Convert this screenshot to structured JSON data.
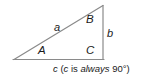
{
  "figure": {
    "type": "right-triangle-diagram",
    "background_color": "#ffffff",
    "stroke_color": "#808080",
    "text_color": "#1a1a1a",
    "vertex_labels": [
      {
        "id": "A",
        "text": "A",
        "x": 38,
        "y": 46,
        "description": "lower-left vertex angle"
      },
      {
        "id": "B",
        "text": "B",
        "x": 86,
        "y": 14,
        "description": "upper-right vertex angle"
      },
      {
        "id": "C",
        "text": "C",
        "x": 86,
        "y": 46,
        "description": "lower-right vertex angle, the right angle"
      }
    ],
    "side_labels": [
      {
        "id": "a",
        "text": "a",
        "x": 54,
        "y": 22,
        "description": "hypotenuse from A to B"
      },
      {
        "id": "b",
        "text": "b",
        "x": 107,
        "y": 29,
        "description": "vertical side from B to C"
      }
    ],
    "geometry": {
      "left_vertex": {
        "x": 14,
        "y": 59
      },
      "top_vertex": {
        "x": 103,
        "y": 5
      },
      "right_vertex": {
        "x": 103,
        "y": 59
      }
    }
  },
  "caption": {
    "side_label": "c",
    "open_paren": " (",
    "angle_label": "c",
    "is_text": " is ",
    "always_text": "always",
    "value_text": " 90°)",
    "full_text": "c (c is always 90°)"
  }
}
